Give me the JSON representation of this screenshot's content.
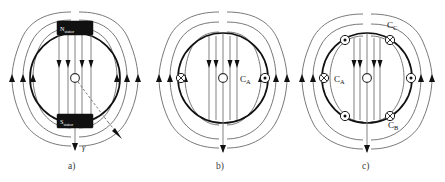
{
  "figure": {
    "title_present": false,
    "background_color": "#ffffff",
    "width": 445,
    "height": 182,
    "panels": [
      {
        "id": "a",
        "caption": "a)",
        "description": "permanent-magnet stator field",
        "magnets": [
          {
            "name": "north-stator-magnet",
            "pole": "N",
            "subscript": "stator",
            "position": "top"
          },
          {
            "name": "south-stator-magnet",
            "pole": "S",
            "subscript": "stator",
            "position": "bottom"
          }
        ],
        "angle_label": "γ",
        "coils": []
      },
      {
        "id": "b",
        "caption": "b)",
        "description": "single phase winding field",
        "magnets": [],
        "coils": [
          {
            "label": "C",
            "subscript": "A",
            "symbol_left": "cross",
            "symbol_right": "dot"
          }
        ],
        "coil_label_text": "C",
        "coil_label_sub": "A"
      },
      {
        "id": "c",
        "caption": "c)",
        "description": "three phase winding field",
        "magnets": [],
        "coils": [
          {
            "label": "C",
            "subscript": "A",
            "position": "left",
            "symbol": "cross"
          },
          {
            "label": "C",
            "subscript": "B",
            "position": "lower-right",
            "symbol": "cross"
          },
          {
            "label": "C",
            "subscript": "C",
            "position": "upper-right",
            "symbol": "cross"
          }
        ],
        "markers": [
          {
            "angle_deg": 180,
            "symbol": "cross"
          },
          {
            "angle_deg": 120,
            "symbol": "dot"
          },
          {
            "angle_deg": 60,
            "symbol": "cross"
          },
          {
            "angle_deg": 0,
            "symbol": "dot"
          },
          {
            "angle_deg": 300,
            "symbol": "cross"
          },
          {
            "angle_deg": 240,
            "symbol": "dot"
          }
        ]
      }
    ],
    "colors": {
      "field_line": "#6a6a6a",
      "rotor_outline": "#111111",
      "magnet_fill": "#111111",
      "magnet_text": "#ffffff",
      "label_text": "#111111",
      "caption_text": "#3a3a3a"
    },
    "labels": {
      "panel_a_caption": "a)",
      "panel_b_caption": "b)",
      "panel_c_caption": "c)",
      "magnet_north_pole": "N",
      "magnet_north_sub": "stator",
      "magnet_south_pole": "S",
      "magnet_south_sub": "stator",
      "gamma": "γ",
      "coil_b_main": "C",
      "coil_b_sub": "A",
      "coil_c_a_main": "C",
      "coil_c_a_sub": "A",
      "coil_c_b_main": "C",
      "coil_c_b_sub": "B",
      "coil_c_c_main": "C",
      "coil_c_c_sub": "C"
    }
  }
}
